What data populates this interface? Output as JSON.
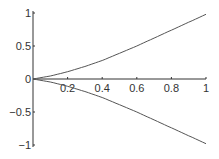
{
  "chart_data": {
    "type": "line",
    "title": "",
    "xlabel": "",
    "ylabel": "",
    "xlim": [
      0,
      1
    ],
    "ylim": [
      -1,
      1
    ],
    "grid": false,
    "x_ticks": [
      "0.2",
      "0.4",
      "0.6",
      "0.8",
      "1"
    ],
    "y_ticks": [
      "1",
      "0.5",
      "0",
      "-0.5",
      "-1"
    ],
    "series": [
      {
        "name": "upper",
        "x": [
          0,
          0.1,
          0.2,
          0.3,
          0.4,
          0.5,
          0.6,
          0.7,
          0.8,
          0.9,
          1.0
        ],
        "values": [
          0,
          0.045,
          0.11,
          0.19,
          0.28,
          0.39,
          0.5,
          0.62,
          0.74,
          0.86,
          0.98
        ]
      },
      {
        "name": "lower",
        "x": [
          0,
          0.1,
          0.2,
          0.3,
          0.4,
          0.5,
          0.6,
          0.7,
          0.8,
          0.9,
          1.0
        ],
        "values": [
          0,
          -0.045,
          -0.11,
          -0.19,
          -0.28,
          -0.39,
          -0.5,
          -0.62,
          -0.74,
          -0.86,
          -0.98
        ]
      }
    ],
    "line_color": "#555555"
  }
}
